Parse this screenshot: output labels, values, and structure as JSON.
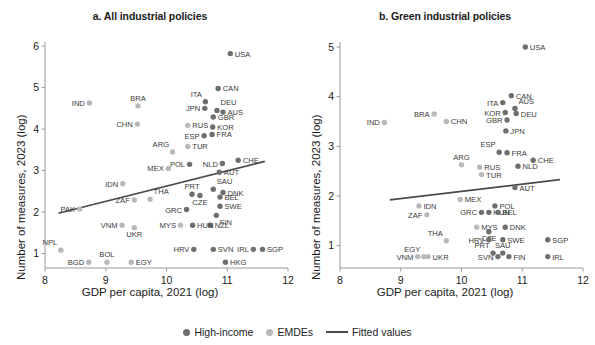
{
  "figure": {
    "ylabel": "Number of measures, 2023 (log)",
    "xlabel": "GDP per capita, 2021 (log)"
  },
  "legend": {
    "items": [
      {
        "label": "High-income",
        "marker": "dot",
        "color": "#6e6e6e"
      },
      {
        "label": "EMDEs",
        "marker": "dot",
        "color": "#b9b9b9"
      },
      {
        "label": "Fitted values",
        "marker": "line",
        "color": "#4a4a4a"
      }
    ]
  },
  "colors": {
    "high_income": "#6e6e6e",
    "emdes": "#b9b9b9",
    "fit_line": "#4a4a4a",
    "axis": "#9a9a9a",
    "text": "#1b1b1b",
    "label_text": "#3a3a3a"
  },
  "chart_data": [
    {
      "type": "scatter",
      "panel": "a",
      "title": "a. All industrial policies",
      "xlabel": "GDP per capita, 2021 (log)",
      "ylabel": "Number of measures, 2023 (log)",
      "xlim": [
        8,
        12
      ],
      "ylim": [
        0.65,
        6.1
      ],
      "xticks": [
        8,
        9,
        10,
        11,
        12
      ],
      "yticks": [
        1,
        2,
        3,
        4,
        5,
        6
      ],
      "grid": false,
      "legend_position": "bottom-center",
      "fit_line": {
        "x": [
          8.22,
          11.62
        ],
        "y": [
          1.97,
          3.22
        ],
        "label": "Fitted values"
      },
      "points": [
        {
          "code": "USA",
          "x": 11.05,
          "y": 5.82,
          "group": "high_income",
          "lpos": "right"
        },
        {
          "code": "CAN",
          "x": 10.85,
          "y": 4.98,
          "group": "high_income",
          "lpos": "right"
        },
        {
          "code": "IND",
          "x": 8.73,
          "y": 4.63,
          "group": "emdes",
          "lpos": "left"
        },
        {
          "code": "BRA",
          "x": 9.53,
          "y": 4.56,
          "group": "emdes",
          "lpos": "above"
        },
        {
          "code": "ITA",
          "x": 10.64,
          "y": 4.66,
          "group": "high_income",
          "lpos": "above-left"
        },
        {
          "code": "JPN",
          "x": 10.63,
          "y": 4.5,
          "group": "high_income",
          "lpos": "left"
        },
        {
          "code": "DEU",
          "x": 10.83,
          "y": 4.45,
          "group": "high_income",
          "lpos": "above-right"
        },
        {
          "code": "AUS",
          "x": 10.93,
          "y": 4.41,
          "group": "high_income",
          "lpos": "right"
        },
        {
          "code": "GBR",
          "x": 10.77,
          "y": 4.29,
          "group": "high_income",
          "lpos": "right"
        },
        {
          "code": "CHN",
          "x": 9.52,
          "y": 4.12,
          "group": "emdes",
          "lpos": "left"
        },
        {
          "code": "RUS",
          "x": 10.35,
          "y": 4.09,
          "group": "emdes",
          "lpos": "right"
        },
        {
          "code": "KOR",
          "x": 10.76,
          "y": 4.05,
          "group": "high_income",
          "lpos": "right"
        },
        {
          "code": "FRA",
          "x": 10.75,
          "y": 3.87,
          "group": "high_income",
          "lpos": "right"
        },
        {
          "code": "ESP",
          "x": 10.62,
          "y": 3.84,
          "group": "high_income",
          "lpos": "left"
        },
        {
          "code": "TUR",
          "x": 10.35,
          "y": 3.58,
          "group": "emdes",
          "lpos": "right"
        },
        {
          "code": "ARG",
          "x": 10.1,
          "y": 3.45,
          "group": "emdes",
          "lpos": "above-left"
        },
        {
          "code": "CHE",
          "x": 11.18,
          "y": 3.25,
          "group": "high_income",
          "lpos": "right"
        },
        {
          "code": "NLD",
          "x": 10.92,
          "y": 3.17,
          "group": "high_income",
          "lpos": "left"
        },
        {
          "code": "POL",
          "x": 10.38,
          "y": 3.15,
          "group": "high_income",
          "lpos": "left"
        },
        {
          "code": "MEX",
          "x": 10.03,
          "y": 3.05,
          "group": "emdes",
          "lpos": "left"
        },
        {
          "code": "AUT",
          "x": 10.87,
          "y": 2.96,
          "group": "high_income",
          "lpos": "right"
        },
        {
          "code": "IDN",
          "x": 9.28,
          "y": 2.68,
          "group": "emdes",
          "lpos": "left"
        },
        {
          "code": "SAU",
          "x": 10.77,
          "y": 2.55,
          "group": "high_income",
          "lpos": "above-right"
        },
        {
          "code": "PRT",
          "x": 10.42,
          "y": 2.43,
          "group": "high_income",
          "lpos": "above"
        },
        {
          "code": "DNK",
          "x": 10.93,
          "y": 2.47,
          "group": "high_income",
          "lpos": "right"
        },
        {
          "code": "CZE",
          "x": 10.55,
          "y": 2.4,
          "group": "high_income",
          "lpos": "below"
        },
        {
          "code": "BEL",
          "x": 10.88,
          "y": 2.36,
          "group": "high_income",
          "lpos": "right"
        },
        {
          "code": "THA",
          "x": 9.73,
          "y": 2.31,
          "group": "emdes",
          "lpos": "above-right"
        },
        {
          "code": "ZAF",
          "x": 9.47,
          "y": 2.29,
          "group": "emdes",
          "lpos": "left"
        },
        {
          "code": "SWE",
          "x": 10.88,
          "y": 2.14,
          "group": "high_income",
          "lpos": "right"
        },
        {
          "code": "PAK",
          "x": 8.57,
          "y": 2.07,
          "group": "emdes",
          "lpos": "left"
        },
        {
          "code": "GRC",
          "x": 10.33,
          "y": 2.06,
          "group": "high_income",
          "lpos": "left"
        },
        {
          "code": "FIN",
          "x": 10.82,
          "y": 1.92,
          "group": "high_income",
          "lpos": "below-right"
        },
        {
          "code": "NZL",
          "x": 10.72,
          "y": 1.68,
          "group": "high_income",
          "lpos": "right"
        },
        {
          "code": "HUN",
          "x": 10.43,
          "y": 1.68,
          "group": "high_income",
          "lpos": "right"
        },
        {
          "code": "MYS",
          "x": 10.23,
          "y": 1.68,
          "group": "emdes",
          "lpos": "left"
        },
        {
          "code": "VNM",
          "x": 9.27,
          "y": 1.68,
          "group": "emdes",
          "lpos": "left"
        },
        {
          "code": "UKR",
          "x": 9.47,
          "y": 1.62,
          "group": "emdes",
          "lpos": "below"
        },
        {
          "code": "SGP",
          "x": 11.58,
          "y": 1.1,
          "group": "high_income",
          "lpos": "right"
        },
        {
          "code": "IRL",
          "x": 11.43,
          "y": 1.1,
          "group": "high_income",
          "lpos": "left"
        },
        {
          "code": "SVN",
          "x": 10.77,
          "y": 1.1,
          "group": "high_income",
          "lpos": "right"
        },
        {
          "code": "HRV",
          "x": 10.45,
          "y": 1.1,
          "group": "high_income",
          "lpos": "left"
        },
        {
          "code": "NPL",
          "x": 8.26,
          "y": 1.08,
          "group": "emdes",
          "lpos": "above-left"
        },
        {
          "code": "HKG",
          "x": 10.97,
          "y": 0.79,
          "group": "high_income",
          "lpos": "right"
        },
        {
          "code": "EGY",
          "x": 9.42,
          "y": 0.79,
          "group": "emdes",
          "lpos": "right"
        },
        {
          "code": "BOL",
          "x": 9.02,
          "y": 0.79,
          "group": "emdes",
          "lpos": "above"
        },
        {
          "code": "BGD",
          "x": 8.72,
          "y": 0.79,
          "group": "emdes",
          "lpos": "left"
        }
      ]
    },
    {
      "type": "scatter",
      "panel": "b",
      "title": "b. Green industrial policies",
      "xlabel": "GDP per capita, 2021 (log)",
      "ylabel": "Number of measures, 2023 (log)",
      "xlim": [
        8,
        12
      ],
      "ylim": [
        0.55,
        5.1
      ],
      "xticks": [
        8,
        9,
        10,
        11,
        12
      ],
      "yticks": [
        1,
        2,
        3,
        4,
        5
      ],
      "grid": false,
      "legend_position": "bottom-center",
      "fit_line": {
        "x": [
          8.82,
          11.62
        ],
        "y": [
          1.92,
          2.33
        ],
        "label": "Fitted values"
      },
      "points": [
        {
          "code": "USA",
          "x": 11.05,
          "y": 5.0,
          "group": "high_income",
          "lpos": "right"
        },
        {
          "code": "CAN",
          "x": 10.82,
          "y": 4.02,
          "group": "high_income",
          "lpos": "right"
        },
        {
          "code": "ITA",
          "x": 10.68,
          "y": 3.88,
          "group": "high_income",
          "lpos": "left"
        },
        {
          "code": "AUS",
          "x": 10.88,
          "y": 3.76,
          "group": "high_income",
          "lpos": "above-right"
        },
        {
          "code": "KOR",
          "x": 10.72,
          "y": 3.68,
          "group": "high_income",
          "lpos": "left"
        },
        {
          "code": "DEU",
          "x": 10.9,
          "y": 3.66,
          "group": "high_income",
          "lpos": "right"
        },
        {
          "code": "BRA",
          "x": 9.55,
          "y": 3.65,
          "group": "emdes",
          "lpos": "left"
        },
        {
          "code": "GBR",
          "x": 10.75,
          "y": 3.53,
          "group": "high_income",
          "lpos": "left"
        },
        {
          "code": "CHN",
          "x": 9.75,
          "y": 3.5,
          "group": "emdes",
          "lpos": "right"
        },
        {
          "code": "IND",
          "x": 8.73,
          "y": 3.48,
          "group": "emdes",
          "lpos": "left"
        },
        {
          "code": "JPN",
          "x": 10.73,
          "y": 3.31,
          "group": "high_income",
          "lpos": "right"
        },
        {
          "code": "ESP",
          "x": 10.62,
          "y": 2.88,
          "group": "high_income",
          "lpos": "above-left"
        },
        {
          "code": "FRA",
          "x": 10.75,
          "y": 2.87,
          "group": "high_income",
          "lpos": "right"
        },
        {
          "code": "CHE",
          "x": 11.18,
          "y": 2.72,
          "group": "high_income",
          "lpos": "right"
        },
        {
          "code": "ARG",
          "x": 10.0,
          "y": 2.63,
          "group": "emdes",
          "lpos": "above"
        },
        {
          "code": "NLD",
          "x": 10.93,
          "y": 2.6,
          "group": "high_income",
          "lpos": "right"
        },
        {
          "code": "RUS",
          "x": 10.3,
          "y": 2.58,
          "group": "emdes",
          "lpos": "right"
        },
        {
          "code": "TUR",
          "x": 10.33,
          "y": 2.43,
          "group": "emdes",
          "lpos": "right"
        },
        {
          "code": "AUT",
          "x": 10.88,
          "y": 2.17,
          "group": "high_income",
          "lpos": "right"
        },
        {
          "code": "MEX",
          "x": 9.98,
          "y": 1.93,
          "group": "emdes",
          "lpos": "right"
        },
        {
          "code": "IDN",
          "x": 9.3,
          "y": 1.8,
          "group": "emdes",
          "lpos": "right"
        },
        {
          "code": "POL",
          "x": 10.55,
          "y": 1.8,
          "group": "high_income",
          "lpos": "right"
        },
        {
          "code": "HUN",
          "x": 10.45,
          "y": 1.67,
          "group": "high_income",
          "lpos": "right"
        },
        {
          "code": "GRC",
          "x": 10.33,
          "y": 1.67,
          "group": "high_income",
          "lpos": "left"
        },
        {
          "code": "BEL",
          "x": 10.6,
          "y": 1.67,
          "group": "high_income",
          "lpos": "right"
        },
        {
          "code": "ZAF",
          "x": 9.43,
          "y": 1.62,
          "group": "emdes",
          "lpos": "left"
        },
        {
          "code": "MYS",
          "x": 10.25,
          "y": 1.37,
          "group": "emdes",
          "lpos": "right"
        },
        {
          "code": "DNK",
          "x": 10.72,
          "y": 1.37,
          "group": "high_income",
          "lpos": "right"
        },
        {
          "code": "CZE",
          "x": 10.45,
          "y": 1.28,
          "group": "high_income",
          "lpos": "below"
        },
        {
          "code": "SGP",
          "x": 11.42,
          "y": 1.12,
          "group": "high_income",
          "lpos": "right"
        },
        {
          "code": "SWE",
          "x": 10.68,
          "y": 1.12,
          "group": "high_income",
          "lpos": "right"
        },
        {
          "code": "HRV",
          "x": 10.45,
          "y": 1.12,
          "group": "high_income",
          "lpos": "left"
        },
        {
          "code": "THA",
          "x": 9.75,
          "y": 1.1,
          "group": "emdes",
          "lpos": "above-left"
        },
        {
          "code": "SAU",
          "x": 10.68,
          "y": 0.85,
          "group": "high_income",
          "lpos": "above"
        },
        {
          "code": "PRT",
          "x": 10.52,
          "y": 0.85,
          "group": "high_income",
          "lpos": "above-left"
        },
        {
          "code": "FIN",
          "x": 10.78,
          "y": 0.78,
          "group": "high_income",
          "lpos": "right"
        },
        {
          "code": "SVN",
          "x": 10.6,
          "y": 0.78,
          "group": "high_income",
          "lpos": "left"
        },
        {
          "code": "IRL",
          "x": 11.42,
          "y": 0.78,
          "group": "high_income",
          "lpos": "right"
        },
        {
          "code": "EGY",
          "x": 9.38,
          "y": 0.78,
          "group": "emdes",
          "lpos": "above-left"
        },
        {
          "code": "UKR",
          "x": 9.45,
          "y": 0.78,
          "group": "emdes",
          "lpos": "right"
        },
        {
          "code": "VNM",
          "x": 9.28,
          "y": 0.78,
          "group": "emdes",
          "lpos": "left"
        }
      ]
    }
  ]
}
